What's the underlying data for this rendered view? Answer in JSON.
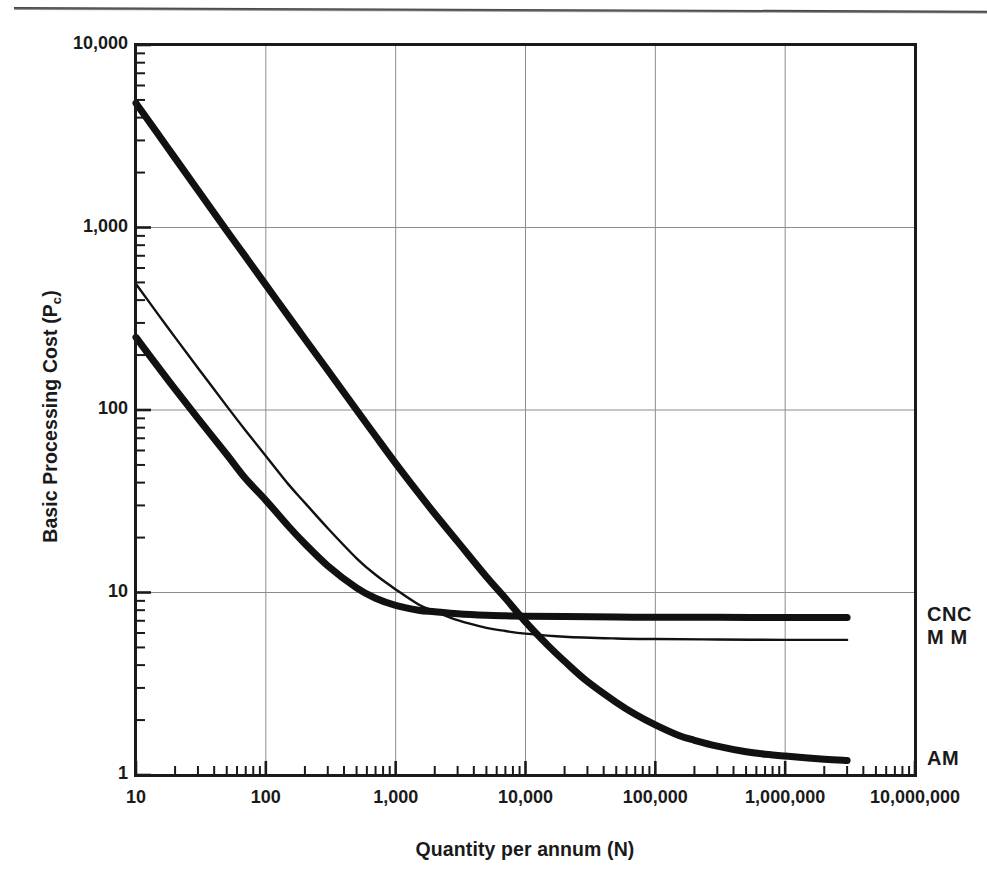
{
  "figure": {
    "y_axis_title_main": "Basic Processing Cost (P",
    "y_axis_title_sub": "c",
    "y_axis_title_close": ")",
    "x_axis_title": "Quantity per annum (N)"
  },
  "chart_data": {
    "type": "line",
    "title": "",
    "subtitle": "",
    "xlabel": "Quantity per annum (N)",
    "ylabel": "Basic Processing Cost (Pc)",
    "xscale": "log",
    "yscale": "log",
    "xlim": [
      10,
      10000000
    ],
    "ylim": [
      1,
      10000
    ],
    "grid": true,
    "grid_axes": "both-major-decades",
    "legend_position": "right-of-plot-inline",
    "x_tick_labels": [
      "10",
      "100",
      "1,000",
      "10,000",
      "100,000",
      "1,000,000",
      "10,000,000"
    ],
    "x_tick_values": [
      10,
      100,
      1000,
      10000,
      100000,
      1000000,
      10000000
    ],
    "y_tick_labels": [
      "10,000",
      "1,000",
      "100",
      "10",
      "1"
    ],
    "y_tick_values": [
      10000,
      1000,
      100,
      10,
      1
    ],
    "minor_ticks": "log-decade-subdivisions-both-axes",
    "series": [
      {
        "name": "CNC",
        "label": "CNC",
        "line_width_px": 7,
        "color": "#111111",
        "asymptote": 7.3,
        "x": [
          10,
          15,
          20,
          30,
          50,
          70,
          100,
          150,
          200,
          300,
          500,
          700,
          1000,
          1500,
          2000,
          3000,
          5000,
          7000,
          10000,
          20000,
          50000,
          100000,
          300000,
          1000000,
          3000000
        ],
        "y": [
          250,
          170,
          130,
          90,
          57,
          42,
          32,
          23,
          18.5,
          14.0,
          10.6,
          9.3,
          8.5,
          8.0,
          7.85,
          7.65,
          7.5,
          7.45,
          7.42,
          7.38,
          7.34,
          7.32,
          7.31,
          7.3,
          7.3
        ]
      },
      {
        "name": "MM",
        "label": "M M",
        "line_width_px": 2.4,
        "color": "#111111",
        "asymptote": 5.5,
        "x": [
          10,
          15,
          20,
          30,
          50,
          70,
          100,
          150,
          200,
          300,
          500,
          700,
          1000,
          1500,
          2000,
          3000,
          5000,
          7000,
          10000,
          20000,
          50000,
          100000,
          300000,
          1000000,
          3000000
        ],
        "y": [
          490,
          330,
          250,
          170,
          105,
          77,
          56,
          39,
          31,
          22.5,
          15.4,
          12.5,
          10.4,
          8.6,
          7.9,
          7.05,
          6.4,
          6.15,
          5.95,
          5.72,
          5.6,
          5.56,
          5.53,
          5.5,
          5.5
        ]
      },
      {
        "name": "AM",
        "label": "AM",
        "line_width_px": 7,
        "color": "#111111",
        "asymptote": 1.2,
        "x": [
          10,
          15,
          20,
          30,
          50,
          70,
          100,
          150,
          200,
          300,
          500,
          700,
          1000,
          1500,
          2000,
          3000,
          5000,
          7000,
          10000,
          15000,
          20000,
          30000,
          50000,
          70000,
          100000,
          150000,
          200000,
          300000,
          500000,
          700000,
          1000000,
          2000000,
          3000000
        ],
        "y": [
          4800,
          3200,
          2400,
          1600,
          960,
          690,
          485,
          325,
          245,
          165,
          100,
          72,
          51,
          35,
          27,
          19,
          12.2,
          9.3,
          6.9,
          5.1,
          4.2,
          3.25,
          2.5,
          2.15,
          1.88,
          1.65,
          1.55,
          1.44,
          1.34,
          1.3,
          1.27,
          1.22,
          1.2
        ]
      }
    ],
    "annotations": [
      {
        "text": "CNC",
        "at_x": 3000000,
        "at_y": 7.3,
        "placement": "right"
      },
      {
        "text": "M M",
        "at_x": 3000000,
        "at_y": 5.5,
        "placement": "right"
      },
      {
        "text": "AM",
        "at_x": 3000000,
        "at_y": 1.2,
        "placement": "right"
      }
    ]
  }
}
